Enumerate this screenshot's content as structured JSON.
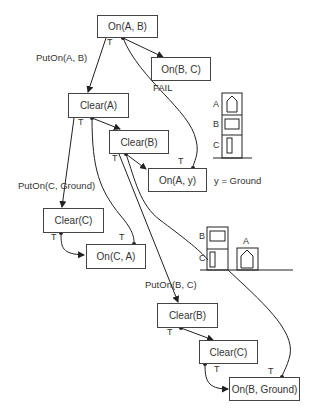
{
  "nodes": {
    "on_a_b": "On(A, B)",
    "on_b_c": "On(B, C)",
    "clear_a": "Clear(A)",
    "clear_b_top": "Clear(B)",
    "on_a_y": "On(A, y)",
    "clear_c_top": "Clear(C)",
    "on_c_a": "On(C, A)",
    "clear_b_bottom": "Clear(B)",
    "clear_c_bottom": "Clear(C)",
    "on_b_ground": "On(B, Ground)"
  },
  "edge_labels": {
    "put_on_a_b": "PutOn(A, B)",
    "put_on_c_ground": "PutOn(C, Ground)",
    "put_on_b_c": "PutOn(B, C)",
    "fail": "FAIL",
    "binding": "y = Ground"
  },
  "true_marker": "T",
  "scenes": {
    "initial": {
      "blocks": [
        "A",
        "B",
        "C"
      ]
    },
    "intermediate": {
      "blocks": [
        "B",
        "C",
        "A"
      ]
    }
  }
}
